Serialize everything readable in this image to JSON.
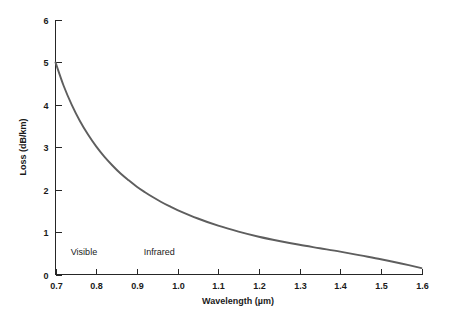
{
  "chart_data": {
    "type": "line",
    "title": "",
    "xlabel": "Wavelength (µm)",
    "ylabel": "Loss (dB/km)",
    "xlim": [
      0.7,
      1.6
    ],
    "ylim": [
      0,
      6
    ],
    "grid": false,
    "legend": "none",
    "xticks": [
      "0.7",
      "0.8",
      "0.9",
      "1.0",
      "1.1",
      "1.2",
      "1.3",
      "1.4",
      "1.5",
      "1.6"
    ],
    "xtick_values": [
      0.7,
      0.8,
      0.9,
      1.0,
      1.1,
      1.2,
      1.3,
      1.4,
      1.5,
      1.6
    ],
    "yticks": [
      "0",
      "1",
      "2",
      "3",
      "4",
      "5",
      "6"
    ],
    "ytick_values": [
      0,
      1,
      2,
      3,
      4,
      5,
      6
    ],
    "series": [
      {
        "name": "Attenuation",
        "color": "#5e5e5e",
        "x": [
          0.7,
          0.72,
          0.74,
          0.76,
          0.78,
          0.8,
          0.82,
          0.84,
          0.86,
          0.88,
          0.9,
          0.92,
          0.94,
          0.96,
          0.98,
          1.0,
          1.05,
          1.1,
          1.15,
          1.2,
          1.25,
          1.3,
          1.35,
          1.4,
          1.45,
          1.5,
          1.55,
          1.6
        ],
        "values": [
          5.0,
          4.45,
          4.0,
          3.62,
          3.3,
          3.02,
          2.78,
          2.57,
          2.38,
          2.22,
          2.07,
          1.94,
          1.82,
          1.71,
          1.61,
          1.52,
          1.32,
          1.15,
          1.01,
          0.89,
          0.79,
          0.7,
          0.62,
          0.54,
          0.45,
          0.36,
          0.26,
          0.15
        ]
      }
    ],
    "annotations": [
      {
        "text": "Visible",
        "x": 0.77,
        "y": 0.55
      },
      {
        "text": "Infrared",
        "x": 0.955,
        "y": 0.55
      }
    ]
  }
}
